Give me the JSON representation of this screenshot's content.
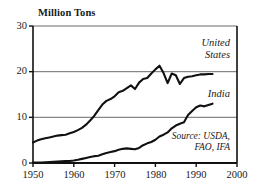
{
  "chart_data": {
    "type": "line",
    "title": "Million Tons",
    "xlabel": "",
    "ylabel": "Million Tons",
    "xlim": [
      1950,
      2000
    ],
    "ylim": [
      0,
      30
    ],
    "xticks": [
      1950,
      1960,
      1970,
      1980,
      1990,
      2000
    ],
    "yticks": [
      0,
      10,
      20,
      30
    ],
    "grid": true,
    "legend_position": "inline-right",
    "annotations": [
      "Source: USDA,",
      "FAO, IFA"
    ],
    "source": "Source: USDA, FAO, IFA",
    "x": [
      1950,
      1951,
      1952,
      1953,
      1954,
      1955,
      1956,
      1957,
      1958,
      1959,
      1960,
      1961,
      1962,
      1963,
      1964,
      1965,
      1966,
      1967,
      1968,
      1969,
      1970,
      1971,
      1972,
      1973,
      1974,
      1975,
      1976,
      1977,
      1978,
      1979,
      1980,
      1981,
      1982,
      1983,
      1984,
      1985,
      1986,
      1987,
      1988,
      1989,
      1990,
      1991,
      1992,
      1993,
      1994
    ],
    "series": [
      {
        "name": "United States",
        "label": "United States",
        "values": [
          4.5,
          4.9,
          5.2,
          5.4,
          5.6,
          5.8,
          6.0,
          6.1,
          6.2,
          6.5,
          6.8,
          7.2,
          7.7,
          8.4,
          9.3,
          10.3,
          11.6,
          12.8,
          13.6,
          14.0,
          14.6,
          15.5,
          15.8,
          16.4,
          17.0,
          16.2,
          17.6,
          18.4,
          18.6,
          19.6,
          20.5,
          21.3,
          19.7,
          17.5,
          19.6,
          19.2,
          17.3,
          18.6,
          18.9,
          19.0,
          19.2,
          19.4,
          19.4,
          19.5,
          19.5
        ]
      },
      {
        "name": "India",
        "label": "India",
        "values": [
          0.1,
          0.1,
          0.1,
          0.15,
          0.2,
          0.25,
          0.3,
          0.35,
          0.4,
          0.45,
          0.55,
          0.7,
          0.9,
          1.1,
          1.3,
          1.5,
          1.6,
          1.9,
          2.2,
          2.4,
          2.6,
          2.9,
          3.1,
          3.2,
          3.1,
          3.0,
          3.3,
          3.9,
          4.3,
          4.6,
          5.1,
          5.8,
          6.2,
          6.7,
          7.6,
          8.2,
          8.6,
          8.9,
          10.5,
          11.4,
          12.2,
          12.6,
          12.4,
          12.7,
          13.0
        ]
      }
    ]
  },
  "axis": {
    "title": "Million Tons",
    "ytick_0": "0",
    "ytick_10": "10",
    "ytick_20": "20",
    "ytick_30": "30",
    "xtick_1950": "1950",
    "xtick_1960": "1960",
    "xtick_1970": "1970",
    "xtick_1980": "1980",
    "xtick_1990": "1990",
    "xtick_2000": "2000"
  },
  "labels": {
    "us_line1": "United",
    "us_line2": "States",
    "india": "India",
    "source_line1": "Source: USDA,",
    "source_line2": "FAO, IFA"
  },
  "colors": {
    "line": "#111111",
    "grid": "#6b6b6b",
    "axis": "#111111",
    "background": "#ffffff",
    "text": "#1a1a1a"
  }
}
